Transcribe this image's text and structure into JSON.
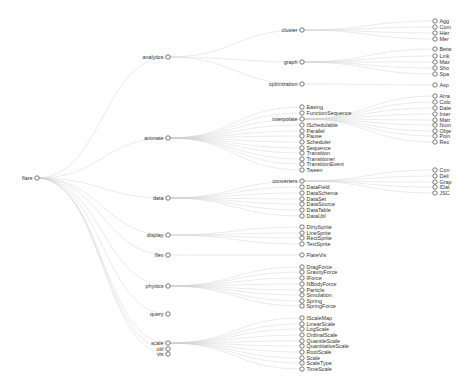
{
  "diagram": {
    "type": "collapsible-tree",
    "root": {
      "name": "flare",
      "x": 37,
      "y": 178,
      "children": [
        {
          "name": "analytics",
          "x": 168,
          "y": 57,
          "children": [
            {
              "name": "cluster",
              "x": 302,
              "y": 30,
              "children": [
                {
                  "name": "Agg",
                  "y": 21
                },
                {
                  "name": "Com",
                  "y": 27
                },
                {
                  "name": "Hier",
                  "y": 33
                },
                {
                  "name": "Mer",
                  "y": 39
                }
              ]
            },
            {
              "name": "graph",
              "x": 302,
              "y": 62,
              "children": [
                {
                  "name": "Betw",
                  "y": 49
                },
                {
                  "name": "Link",
                  "y": 56
                },
                {
                  "name": "Max",
                  "y": 62
                },
                {
                  "name": "Sho",
                  "y": 68
                },
                {
                  "name": "Spa",
                  "y": 74
                }
              ]
            },
            {
              "name": "optimization",
              "x": 302,
              "y": 84,
              "children": [
                {
                  "name": "Asp",
                  "y": 85
                }
              ]
            }
          ]
        },
        {
          "name": "animate",
          "x": 168,
          "y": 138,
          "children": [
            {
              "name": "Easing",
              "x": 302,
              "y": 107
            },
            {
              "name": "FunctionSequence",
              "x": 302,
              "y": 113
            },
            {
              "name": "interpolate",
              "x": 302,
              "y": 119,
              "children": [
                {
                  "name": "Arra",
                  "y": 96
                },
                {
                  "name": "Colo",
                  "y": 102
                },
                {
                  "name": "Date",
                  "y": 108
                },
                {
                  "name": "Inter",
                  "y": 114
                },
                {
                  "name": "Matr",
                  "y": 120
                },
                {
                  "name": "Num",
                  "y": 125
                },
                {
                  "name": "Obje",
                  "y": 131
                },
                {
                  "name": "Poin",
                  "y": 136
                },
                {
                  "name": "Rec",
                  "y": 142
                }
              ]
            },
            {
              "name": "ISchedulable",
              "x": 302,
              "y": 125
            },
            {
              "name": "Parallel",
              "x": 302,
              "y": 131
            },
            {
              "name": "Pause",
              "x": 302,
              "y": 136
            },
            {
              "name": "Scheduler",
              "x": 302,
              "y": 142
            },
            {
              "name": "Sequence",
              "x": 302,
              "y": 148
            },
            {
              "name": "Transition",
              "x": 302,
              "y": 153
            },
            {
              "name": "Transitioner",
              "x": 302,
              "y": 159
            },
            {
              "name": "TransitionEvent",
              "x": 302,
              "y": 164
            },
            {
              "name": "Tween",
              "x": 302,
              "y": 170
            }
          ]
        },
        {
          "name": "data",
          "x": 168,
          "y": 198,
          "children": [
            {
              "name": "converters",
              "x": 302,
              "y": 181,
              "children": [
                {
                  "name": "Con",
                  "y": 170
                },
                {
                  "name": "Deli",
                  "y": 176
                },
                {
                  "name": "Grap",
                  "y": 182
                },
                {
                  "name": "IDat",
                  "y": 187
                },
                {
                  "name": "JSC",
                  "y": 193
                }
              ]
            },
            {
              "name": "DataField",
              "x": 302,
              "y": 187
            },
            {
              "name": "DataSchema",
              "x": 302,
              "y": 193
            },
            {
              "name": "DataSet",
              "x": 302,
              "y": 199
            },
            {
              "name": "DataSource",
              "x": 302,
              "y": 204
            },
            {
              "name": "DataTable",
              "x": 302,
              "y": 210
            },
            {
              "name": "DataUtil",
              "x": 302,
              "y": 216
            }
          ]
        },
        {
          "name": "display",
          "x": 168,
          "y": 235,
          "children": [
            {
              "name": "DirtySprite",
              "x": 302,
              "y": 227
            },
            {
              "name": "LineSprite",
              "x": 302,
              "y": 233
            },
            {
              "name": "RectSprite",
              "x": 302,
              "y": 238
            },
            {
              "name": "TextSprite",
              "x": 302,
              "y": 244
            }
          ]
        },
        {
          "name": "flex",
          "x": 168,
          "y": 255,
          "children": [
            {
              "name": "FlareVis",
              "x": 302,
              "y": 255
            }
          ]
        },
        {
          "name": "physics",
          "x": 168,
          "y": 286,
          "children": [
            {
              "name": "DragForce",
              "x": 302,
              "y": 267
            },
            {
              "name": "GravityForce",
              "x": 302,
              "y": 272
            },
            {
              "name": "IForce",
              "x": 302,
              "y": 278
            },
            {
              "name": "NBodyForce",
              "x": 302,
              "y": 284
            },
            {
              "name": "Particle",
              "x": 302,
              "y": 290
            },
            {
              "name": "Simulation",
              "x": 302,
              "y": 295
            },
            {
              "name": "Spring",
              "x": 302,
              "y": 301
            },
            {
              "name": "SpringForce",
              "x": 302,
              "y": 306
            }
          ]
        },
        {
          "name": "query",
          "x": 168,
          "y": 314,
          "children": []
        },
        {
          "name": "scale",
          "x": 168,
          "y": 343,
          "children": [
            {
              "name": "IScaleMap",
              "x": 302,
              "y": 318
            },
            {
              "name": "LinearScale",
              "x": 302,
              "y": 324
            },
            {
              "name": "LogScale",
              "x": 302,
              "y": 329
            },
            {
              "name": "OrdinalScale",
              "x": 302,
              "y": 335
            },
            {
              "name": "QuantileScale",
              "x": 302,
              "y": 341
            },
            {
              "name": "QuantitativeScale",
              "x": 302,
              "y": 346
            },
            {
              "name": "RootScale",
              "x": 302,
              "y": 352
            },
            {
              "name": "Scale",
              "x": 302,
              "y": 358
            },
            {
              "name": "ScaleType",
              "x": 302,
              "y": 363
            },
            {
              "name": "TimeScale",
              "x": 302,
              "y": 369
            }
          ]
        },
        {
          "name": "util",
          "x": 168,
          "y": 349,
          "children": []
        },
        {
          "name": "vis",
          "x": 168,
          "y": 354,
          "children": []
        }
      ]
    },
    "leaf_column_x": 435,
    "colors": {
      "link": "#cccccc",
      "node_stroke": "#555555",
      "node_fill": "#ffffff",
      "text": "#333333",
      "background": "#ffffff"
    }
  }
}
